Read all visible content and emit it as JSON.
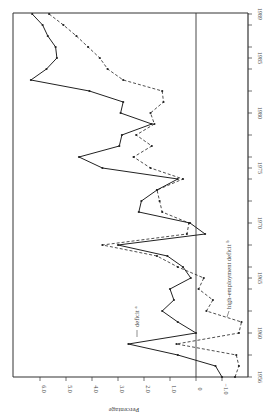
{
  "chart_data": {
    "type": "line",
    "orientation": "rotated-90-clockwise",
    "title": "",
    "xlabel": "",
    "ylabel": "Percentage",
    "x_axis": {
      "ticks_labeled": [
        1956,
        1960,
        1965,
        1970,
        1975,
        1980,
        1985,
        1989
      ],
      "range": [
        1956,
        1989
      ]
    },
    "y_axis": {
      "tick_labels": [
        "6.0",
        "5.0",
        "4.0",
        "3.0",
        "2.0",
        "1.0",
        "0",
        "−1.0"
      ],
      "tick_values": [
        6.0,
        5.0,
        4.0,
        3.0,
        2.0,
        1.0,
        0,
        -1.0
      ],
      "range": [
        -2.0,
        7.0
      ]
    },
    "zero_line": true,
    "grid": false,
    "x": [
      1956,
      1957,
      1958,
      1959,
      1960,
      1961,
      1962,
      1963,
      1964,
      1965,
      1966,
      1967,
      1968,
      1969,
      1970,
      1971,
      1972,
      1973,
      1974,
      1975,
      1976,
      1977,
      1978,
      1979,
      1980,
      1981,
      1982,
      1983,
      1984,
      1985,
      1986,
      1987,
      1988,
      1989
    ],
    "series": [
      {
        "name": "deficit",
        "label": "deficit",
        "footnote": "a",
        "style": "solid",
        "values": [
          -1.0,
          -0.75,
          0.7,
          2.6,
          0.0,
          0.7,
          1.3,
          0.85,
          1.0,
          0.2,
          0.5,
          1.1,
          3.0,
          -0.35,
          0.23,
          2.2,
          2.1,
          1.5,
          0.7,
          3.6,
          4.5,
          2.95,
          2.85,
          1.7,
          2.9,
          2.8,
          4.1,
          6.35,
          5.75,
          5.35,
          5.4,
          5.7,
          5.9,
          6.3
        ]
      },
      {
        "name": "high-employment deficit",
        "label": "high-employment deficit",
        "footnote": "b",
        "style": "dashed",
        "values": [
          -1.5,
          -1.65,
          -1.55,
          0.75,
          -1.65,
          -1.75,
          -0.4,
          -0.65,
          -0.1,
          -0.3,
          0.7,
          1.5,
          3.6,
          0.35,
          0.27,
          1.3,
          1.4,
          1.5,
          0.5,
          1.75,
          2.4,
          1.7,
          2.3,
          1.6,
          1.75,
          1.25,
          1.3,
          2.8,
          3.4,
          3.7,
          4.15,
          4.6,
          5.1,
          5.65
        ]
      }
    ],
    "legend": "inline labels with leader lines",
    "colors": {
      "line": "#222222",
      "axis": "#333333",
      "text": "#444444"
    }
  },
  "labels": {
    "axis_title": "Percentage",
    "deficit": "deficit",
    "deficit_sup": "a",
    "hed": "high-employment deficit",
    "hed_sup": "b"
  }
}
